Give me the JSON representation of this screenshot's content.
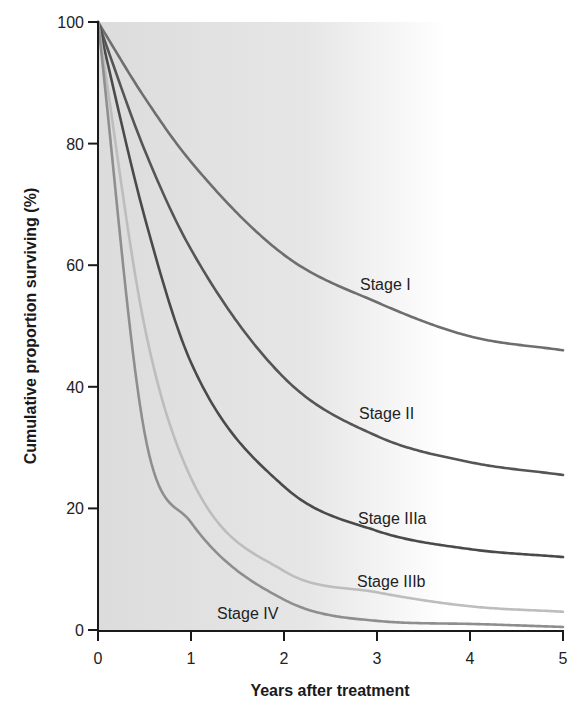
{
  "chart_data": {
    "type": "line",
    "title": "",
    "xlabel": "Years after treatment",
    "ylabel": "Cumulative proportion surviving (%)",
    "xlim": [
      0,
      5
    ],
    "ylim": [
      0,
      100
    ],
    "x_ticks": [
      0,
      1,
      2,
      3,
      4,
      5
    ],
    "y_ticks": [
      0,
      20,
      40,
      60,
      80,
      100
    ],
    "grid": false,
    "legend": "inline labels next to curves",
    "x": [
      0,
      0.5,
      1,
      2,
      3,
      4,
      5
    ],
    "series": [
      {
        "name": "Stage I",
        "color": "#6e6e6e",
        "values": [
          100,
          87.6,
          77,
          61.7,
          53.9,
          48.3,
          46
        ],
        "label_pos": [
          360,
          284
        ]
      },
      {
        "name": "Stage II",
        "color": "#555555",
        "values": [
          100,
          79,
          62.6,
          41.5,
          31.9,
          27.6,
          25.5
        ],
        "label_pos": [
          359,
          413
        ]
      },
      {
        "name": "Stage IIIa",
        "color": "#4a4a4a",
        "values": [
          100,
          68,
          44,
          23.6,
          16.3,
          13.3,
          12
        ],
        "label_pos": [
          358,
          518
        ]
      },
      {
        "name": "Stage IIIb",
        "color": "#bdbdbd",
        "values": [
          100,
          50,
          25,
          9.7,
          6.2,
          3.9,
          3
        ],
        "label_pos": [
          357,
          581
        ]
      },
      {
        "name": "Stage IV",
        "color": "#8e8e8e",
        "values": [
          100,
          32.5,
          17.7,
          5,
          1.5,
          1,
          0.5
        ],
        "label_pos": [
          217,
          613
        ]
      }
    ]
  }
}
